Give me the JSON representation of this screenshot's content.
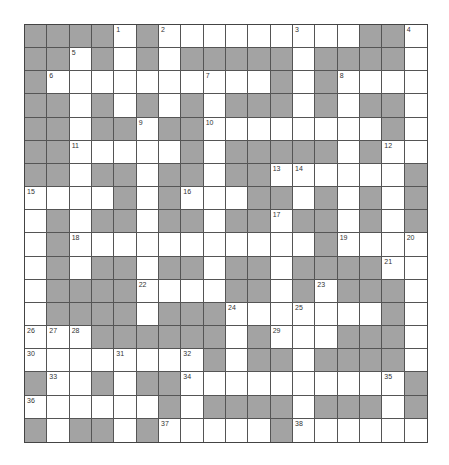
{
  "puzzle": {
    "rows": 18,
    "cols": 18,
    "colors": {
      "block": "#a3a3a3",
      "open": "#ffffff",
      "line": "#555555"
    },
    "legend": "B = shaded block, W = open cell",
    "grid": [
      "BBBBWBWWWWWWWWWBBW",
      "BBWBWBWBBBBBWBBBBW",
      "BWWWWWWWWWWBWBWWWW",
      "BBWBWBWBWBBBWBWBBW",
      "BBWBBWBBWWWWWWWWBW",
      "BBWWWWWBWBBBBBWBWW",
      "BBWBBWBBWBBWWWWWWB",
      "WWWWBWBWWWBBWBWBWB",
      "WBWBBWBBWBBWBBWBWB",
      "WBWWWWWWWWWWWBWWWW",
      "WBWBBWBBWBBWBBBBWW",
      "WBBBBWWWWBBWBWBBBW",
      "WBBBBWBBBWWWWWWWBW",
      "WWWBBBBBBWBWWWBBBW",
      "WWWWWWWWBWBBWBBBBW",
      "BWWBWBBWWWWWWWWWWB",
      "WWWWWWBWBBBBWBBBWB",
      "BWBBWBWWWWWBWWWWWW"
    ],
    "numbers": [
      {
        "n": 1,
        "r": 0,
        "c": 4
      },
      {
        "n": 2,
        "r": 0,
        "c": 6
      },
      {
        "n": 3,
        "r": 0,
        "c": 12
      },
      {
        "n": 4,
        "r": 0,
        "c": 17
      },
      {
        "n": 5,
        "r": 1,
        "c": 2
      },
      {
        "n": 6,
        "r": 2,
        "c": 1
      },
      {
        "n": 7,
        "r": 2,
        "c": 8
      },
      {
        "n": 8,
        "r": 2,
        "c": 14
      },
      {
        "n": 9,
        "r": 4,
        "c": 5
      },
      {
        "n": 10,
        "r": 4,
        "c": 8
      },
      {
        "n": 11,
        "r": 5,
        "c": 2
      },
      {
        "n": 12,
        "r": 5,
        "c": 16
      },
      {
        "n": 13,
        "r": 6,
        "c": 11
      },
      {
        "n": 14,
        "r": 6,
        "c": 12
      },
      {
        "n": 15,
        "r": 7,
        "c": 0
      },
      {
        "n": 16,
        "r": 7,
        "c": 7
      },
      {
        "n": 17,
        "r": 8,
        "c": 11
      },
      {
        "n": 18,
        "r": 9,
        "c": 2
      },
      {
        "n": 19,
        "r": 9,
        "c": 14
      },
      {
        "n": 20,
        "r": 9,
        "c": 17
      },
      {
        "n": 21,
        "r": 10,
        "c": 16
      },
      {
        "n": 22,
        "r": 11,
        "c": 5
      },
      {
        "n": 23,
        "r": 11,
        "c": 13
      },
      {
        "n": 24,
        "r": 12,
        "c": 9
      },
      {
        "n": 25,
        "r": 12,
        "c": 12
      },
      {
        "n": 26,
        "r": 13,
        "c": 0
      },
      {
        "n": 27,
        "r": 13,
        "c": 1
      },
      {
        "n": 28,
        "r": 13,
        "c": 2
      },
      {
        "n": 29,
        "r": 13,
        "c": 11
      },
      {
        "n": 30,
        "r": 14,
        "c": 0
      },
      {
        "n": 31,
        "r": 14,
        "c": 4
      },
      {
        "n": 32,
        "r": 14,
        "c": 7
      },
      {
        "n": 33,
        "r": 15,
        "c": 1
      },
      {
        "n": 34,
        "r": 15,
        "c": 7
      },
      {
        "n": 35,
        "r": 15,
        "c": 16
      },
      {
        "n": 36,
        "r": 16,
        "c": 0
      },
      {
        "n": 37,
        "r": 17,
        "c": 6
      },
      {
        "n": 38,
        "r": 17,
        "c": 12
      }
    ]
  }
}
